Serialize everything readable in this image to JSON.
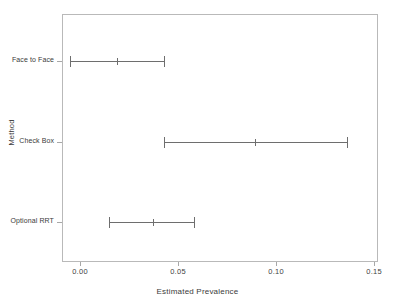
{
  "chart_data": {
    "type": "bar",
    "orientation": "horizontal",
    "title": "",
    "xlabel": "Estimated Prevalence",
    "ylabel": "Method",
    "xlim": [
      -0.0092,
      0.152
    ],
    "xticks": [
      0.0,
      0.05,
      0.1,
      0.15
    ],
    "xticklabels": [
      "0.00",
      "0.05",
      "0.10",
      "0.15"
    ],
    "grid": false,
    "legend": null,
    "categories": [
      "Face to Face",
      "Check Box",
      "Optional RRT"
    ],
    "series": [
      {
        "name": "Estimated Prevalence",
        "values": [
          0.019,
          0.089,
          0.037
        ],
        "lower": [
          -0.005,
          0.043,
          0.015
        ],
        "upper": [
          0.043,
          0.136,
          0.058
        ]
      }
    ],
    "points": [
      {
        "category": "Face to Face",
        "estimate": 0.019,
        "lower": -0.005,
        "upper": 0.043
      },
      {
        "category": "Check Box",
        "estimate": 0.089,
        "lower": 0.043,
        "upper": 0.136
      },
      {
        "category": "Optional RRT",
        "estimate": 0.037,
        "lower": 0.015,
        "upper": 0.058
      }
    ],
    "colors": {
      "line": "#6e6e6e",
      "frame": "#b9b9b9",
      "text": "#3a3a3a",
      "background": "#ffffff"
    }
  }
}
